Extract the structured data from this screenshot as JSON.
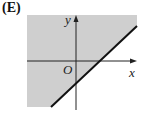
{
  "figure": {
    "option_label": "(E)",
    "axis_labels": {
      "x": "x",
      "y": "y",
      "origin": "O"
    },
    "shading_color": "#cfcfcf",
    "line_color": "#111111",
    "axis_color": "#222222"
  }
}
